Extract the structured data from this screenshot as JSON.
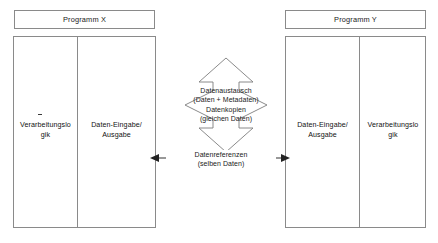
{
  "diagram": {
    "title_hidden": "",
    "programs": [
      {
        "id": "program-x",
        "header_label": "Programm X",
        "cells": [
          {
            "id": "logic",
            "label": "Verarbeitungslo\ngik"
          },
          {
            "id": "io",
            "label": "Daten-Eingabe/\nAusgabe"
          }
        ]
      },
      {
        "id": "program-y",
        "header_label": "Programm Y",
        "cells": [
          {
            "id": "io",
            "label": "Daten-Eingabe/\nAusgabe"
          },
          {
            "id": "logic",
            "label": "Verarbeitungslo\ngik"
          }
        ]
      }
    ],
    "vertical_arrow": {
      "name": "data-exchange-arrow",
      "lines": [
        "Datenaustausch",
        "(Daten + Metadaten)",
        "Datenkopien",
        "(gleichen Daten)"
      ],
      "line1": "Datenaustausch",
      "line2": "(Daten + Metadaten)",
      "line3": "Datenkopien",
      "line4": "(gleichen Daten)"
    },
    "horizontal_arrow": {
      "name": "data-reference-arrow",
      "line1": "Datenreferenzen",
      "line2": "(selben Daten)"
    },
    "colors": {
      "stroke": "#8a8a8a",
      "arrow_stroke": "#6f6f6f",
      "text": "#1a1a1a",
      "background": "#ffffff"
    }
  }
}
